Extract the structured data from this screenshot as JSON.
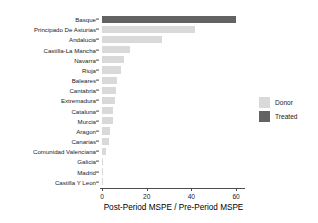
{
  "chart_data": {
    "type": "bar",
    "orientation": "horizontal",
    "title": "",
    "xlabel": "Post-Period MSPE / Pre-Period MSPE",
    "ylabel": "",
    "xlim": [
      0,
      64
    ],
    "xticks": [
      0,
      20,
      40,
      60
    ],
    "xticklabels": [
      "0",
      "20",
      "40",
      "60"
    ],
    "grid": false,
    "legend_position": "right",
    "categories": [
      "Basque",
      "Principado De Asturias",
      "Andalucia",
      "Castilla-La Mancha",
      "Navarra",
      "Rioja",
      "Baleares",
      "Cantabria",
      "Extremadura",
      "Cataluna",
      "Murcia",
      "Aragon",
      "Canarias",
      "Comunidad Valenciana",
      "Galicia",
      "Madrid",
      "Castilla Y Leon"
    ],
    "values": [
      60.0,
      41.8,
      27.0,
      12.6,
      9.8,
      8.4,
      6.9,
      6.2,
      6.0,
      5.1,
      4.9,
      3.7,
      3.3,
      1.8,
      0.4,
      0.3,
      0.2
    ],
    "groups": [
      "Treated",
      "Donor",
      "Donor",
      "Donor",
      "Donor",
      "Donor",
      "Donor",
      "Donor",
      "Donor",
      "Donor",
      "Donor",
      "Donor",
      "Donor",
      "Donor",
      "Donor",
      "Donor",
      "Donor"
    ],
    "colors": {
      "Donor": "#d9d9d9",
      "Treated": "#636363"
    },
    "legend": [
      {
        "label": "Donor",
        "color": "#d9d9d9"
      },
      {
        "label": "Treated",
        "color": "#636363"
      }
    ],
    "axis_color": "#4d4d4d",
    "background": "#ffffff"
  }
}
